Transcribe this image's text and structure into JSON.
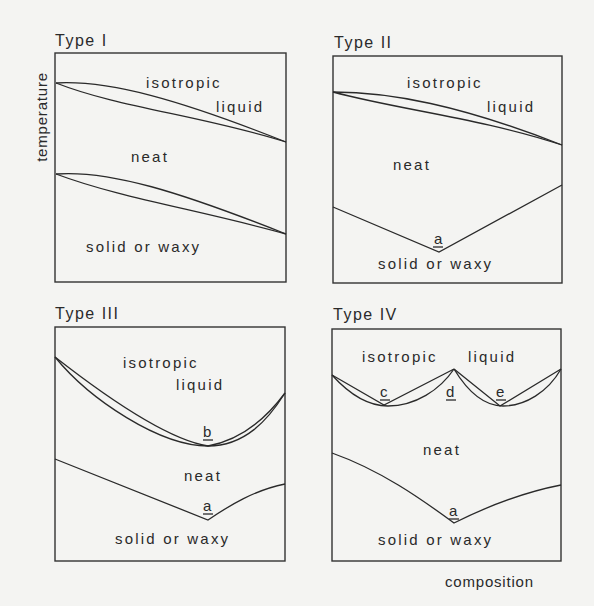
{
  "figure": {
    "y_axis_label": "temperature",
    "x_axis_label": "composition",
    "panels": [
      {
        "title": "Type I",
        "regions": {
          "top": "isotropic",
          "top2": "liquid",
          "middle": "neat",
          "bottom": "solid or waxy"
        },
        "points": []
      },
      {
        "title": "Type II",
        "regions": {
          "top": "isotropic",
          "top2": "liquid",
          "middle": "neat",
          "bottom": "solid or waxy"
        },
        "points": [
          "a"
        ]
      },
      {
        "title": "Type III",
        "regions": {
          "top": "isotropic",
          "top2": "liquid",
          "middle": "neat",
          "bottom": "solid or waxy"
        },
        "points": [
          "b",
          "a"
        ]
      },
      {
        "title": "Type IV",
        "regions": {
          "top": "isotropic",
          "top2": "liquid",
          "middle": "neat",
          "bottom": "solid or waxy"
        },
        "points": [
          "c",
          "d",
          "e",
          "a"
        ]
      }
    ]
  },
  "colors": {
    "ink": "#2a2a2a",
    "paper": "#f4f4f2"
  }
}
